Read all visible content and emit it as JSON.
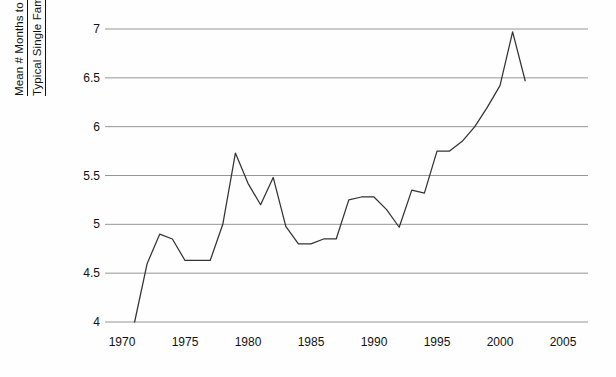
{
  "chart_data": {
    "type": "line",
    "title": "",
    "xlabel": "",
    "ylabel": "Mean # Months to Construct Typical Single Family Home",
    "ylabel_line1": "Mean # Months to Construct",
    "ylabel_line2": "Typical Single Family Home",
    "xlim": [
      1969,
      2006
    ],
    "ylim": [
      4,
      7
    ],
    "xticks": [
      1970,
      1975,
      1980,
      1985,
      1990,
      1995,
      2000,
      2005
    ],
    "xtick_labels": [
      "1970",
      "1975",
      "1980",
      "1985",
      "1990",
      "1995",
      "2000",
      "2005"
    ],
    "yticks": [
      4,
      4.5,
      5,
      5.5,
      6,
      6.5,
      7
    ],
    "ytick_labels": [
      "4",
      "4.5",
      "5",
      "5.5",
      "6",
      "6.5",
      "7"
    ],
    "grid": true,
    "grid_axis": "y",
    "legend": "none",
    "line_color": "#333333",
    "grid_color": "#8a8a8a",
    "background_color": "#fefefe",
    "x": [
      1971,
      1972,
      1973,
      1974,
      1975,
      1976,
      1977,
      1978,
      1979,
      1980,
      1981,
      1982,
      1983,
      1984,
      1985,
      1986,
      1987,
      1988,
      1989,
      1990,
      1991,
      1992,
      1993,
      1994,
      1995,
      1996,
      1997,
      1998,
      1999,
      2000,
      2001,
      2002
    ],
    "values": [
      4.0,
      4.6,
      4.9,
      4.85,
      4.63,
      4.63,
      4.63,
      5.0,
      5.73,
      5.42,
      5.2,
      5.48,
      4.98,
      4.8,
      4.8,
      4.85,
      4.85,
      5.25,
      5.28,
      5.28,
      5.15,
      4.97,
      5.35,
      5.32,
      5.75,
      5.75,
      5.85,
      6.0,
      6.2,
      6.42,
      6.97,
      6.47
    ],
    "series_name": "Mean months to construct"
  },
  "axis": {
    "y_title_line1": "Mean # Months to Construct",
    "y_title_line2": "Typical Single Family Home"
  }
}
